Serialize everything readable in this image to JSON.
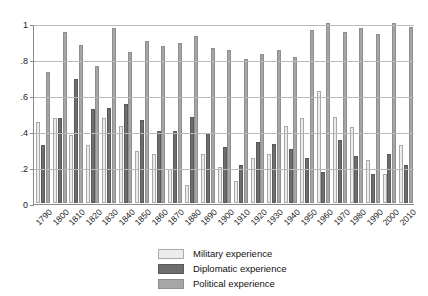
{
  "chart_data": {
    "type": "bar",
    "title": "",
    "xlabel": "",
    "ylabel": "",
    "ylim": [
      0,
      1
    ],
    "yticks": [
      0,
      0.2,
      0.4,
      0.6,
      0.8,
      1
    ],
    "ytick_labels": [
      "0",
      ".2",
      ".4",
      ".6",
      ".8",
      "1"
    ],
    "grid": true,
    "legend_position": "bottom-center",
    "categories": [
      "1790",
      "1800",
      "1810",
      "1820",
      "1830",
      "1840",
      "1850",
      "1860",
      "1870",
      "1880",
      "1890",
      "1900",
      "1910",
      "1920",
      "1930",
      "1940",
      "1950",
      "1960",
      "1970",
      "1980",
      "1990",
      "2000",
      "2010"
    ],
    "series": [
      {
        "name": "Military experience",
        "color": "#ececec",
        "values": [
          0.45,
          0.47,
          0.38,
          0.32,
          0.47,
          0.43,
          0.29,
          0.27,
          0.19,
          0.1,
          0.27,
          0.2,
          0.12,
          0.25,
          0.27,
          0.43,
          0.47,
          0.62,
          0.48,
          0.42,
          0.24,
          0.16,
          0.32
        ]
      },
      {
        "name": "Diplomatic experience",
        "color": "#6e6e6e",
        "values": [
          0.32,
          0.47,
          0.69,
          0.52,
          0.53,
          0.55,
          0.46,
          0.4,
          0.4,
          0.48,
          0.39,
          0.31,
          0.21,
          0.34,
          0.33,
          0.3,
          0.25,
          0.17,
          0.35,
          0.26,
          0.16,
          0.27,
          0.21
        ]
      },
      {
        "name": "Political experience",
        "color": "#a6a6a6",
        "values": [
          0.73,
          0.95,
          0.88,
          0.76,
          0.97,
          0.84,
          0.9,
          0.87,
          0.89,
          0.93,
          0.86,
          0.85,
          0.8,
          0.83,
          0.85,
          0.81,
          0.96,
          1.0,
          0.95,
          0.97,
          0.94,
          1.0,
          0.98
        ]
      }
    ]
  },
  "legend": {
    "items": [
      {
        "label": "Military experience",
        "key": "mil"
      },
      {
        "label": "Diplomatic experience",
        "key": "dip"
      },
      {
        "label": "Political experience",
        "key": "pol"
      }
    ]
  }
}
